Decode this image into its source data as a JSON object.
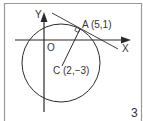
{
  "diagram": {
    "type": "geometry",
    "axes": {
      "x_label": "X",
      "y_label": "Y",
      "origin_label": "O"
    },
    "points": {
      "A": {
        "label": "A (5,1)",
        "x": 5,
        "y": 1
      },
      "C": {
        "label": "C (2,−3)",
        "x": 2,
        "y": -3
      }
    },
    "elements": [
      "circle centered at C passing through A",
      "radius segment CA",
      "tangent line at A perpendicular to CA",
      "right-angle marker at A"
    ],
    "figure_number": "3"
  },
  "colors": {
    "stroke": "#2b2b2b",
    "frame": "#9a9a9a",
    "text": "#333333",
    "background": "#ffffff"
  }
}
